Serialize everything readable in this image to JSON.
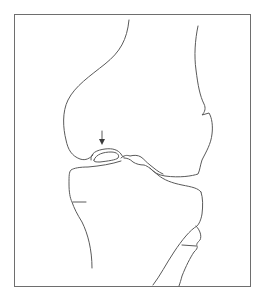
{
  "figure": {
    "subject": "Knee joint lateral view line drawing",
    "annotation": "arrow",
    "colors": {
      "background": "#ffffff",
      "line": "#5a5a5a",
      "frame": "#6e6e6e"
    }
  }
}
